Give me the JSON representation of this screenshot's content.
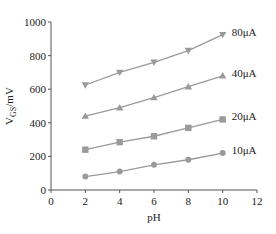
{
  "chart_data": {
    "type": "line",
    "title": "",
    "xlabel": "pH",
    "ylabel": "V_GS/mV",
    "ylabel_main": "V",
    "ylabel_sub": "GS",
    "ylabel_unit": "/mV",
    "x": [
      2,
      4,
      6,
      8,
      10
    ],
    "xlim": [
      0,
      12
    ],
    "ylim": [
      0,
      1000
    ],
    "xticks": [
      0,
      2,
      4,
      6,
      8,
      10,
      12
    ],
    "yticks": [
      0,
      200,
      400,
      600,
      800,
      1000
    ],
    "grid": false,
    "legend_position": "inline labels at right end of each series",
    "series": [
      {
        "name": "10μA",
        "marker": "circle",
        "values": [
          80,
          110,
          150,
          180,
          220
        ]
      },
      {
        "name": "20μA",
        "marker": "square",
        "values": [
          240,
          285,
          320,
          370,
          420
        ]
      },
      {
        "name": "40μA",
        "marker": "triangle-up",
        "values": [
          440,
          490,
          550,
          615,
          680
        ]
      },
      {
        "name": "80μA",
        "marker": "triangle-down",
        "values": [
          625,
          700,
          760,
          830,
          925
        ]
      }
    ],
    "colors": {
      "line": "#9a9a9a",
      "marker": "#9a9a9a",
      "axis": "#555555"
    }
  }
}
